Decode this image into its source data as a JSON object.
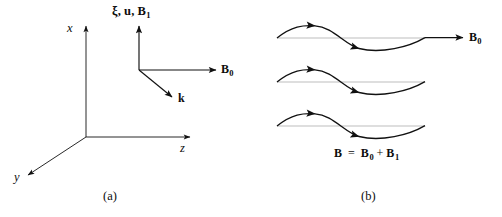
{
  "figure": {
    "background_color": "#ffffff",
    "stroke_color": "#111111",
    "baseline_color": "#b9b9b9"
  },
  "panel_a": {
    "caption": "(a)",
    "axes": [
      {
        "name": "x-axis",
        "label": "x",
        "direction": "up"
      },
      {
        "name": "z-axis",
        "label": "z",
        "direction": "right"
      },
      {
        "name": "y-axis",
        "label": "y",
        "direction": "down-left"
      }
    ],
    "vector_triad": {
      "perturbation_label": "ξ, u, B",
      "perturbation_sub": "1",
      "field_label": "B",
      "field_sub": "0",
      "wavevector_label": "k"
    }
  },
  "panel_b": {
    "caption": "(b)",
    "field_label": "B",
    "field_sub": "0",
    "equation": {
      "lhs": "B",
      "eq": "=",
      "term1": "B",
      "term1_sub": "0",
      "plus": "+",
      "term2": "B",
      "term2_sub": "1"
    },
    "waves": [
      {
        "name": "wave-top",
        "baseline_y": 38,
        "amplitude": 13,
        "with_field_arrow": true
      },
      {
        "name": "wave-middle",
        "baseline_y": 82,
        "amplitude": 13,
        "with_field_arrow": false
      },
      {
        "name": "wave-bottom",
        "baseline_y": 126,
        "amplitude": 13,
        "with_field_arrow": false
      }
    ]
  }
}
